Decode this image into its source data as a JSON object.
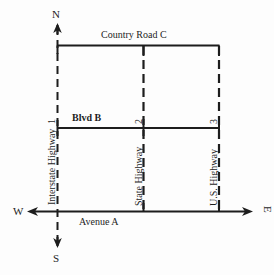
{
  "diagram": {
    "background_color": "#fdfdfd",
    "line_color": "#1d1d1d",
    "compass": {
      "north": "N",
      "south": "S",
      "west": "W",
      "east": "E"
    },
    "roads": [
      {
        "id": "country-road-c",
        "label": "Country Road C",
        "orientation": "horizontal",
        "style": "solid",
        "label_position": "above-center"
      },
      {
        "id": "blvd-b",
        "label": "Blvd B",
        "orientation": "horizontal",
        "style": "solid",
        "label_position": "above-left"
      },
      {
        "id": "avenue-a",
        "label": "Avenue A",
        "orientation": "horizontal",
        "style": "solid-axis-arrows",
        "label_position": "below-left"
      },
      {
        "id": "interstate-highway-1",
        "label": "Interstate Highway",
        "number": "1",
        "orientation": "vertical",
        "style": "dashed-axis-arrows",
        "label_position": "rotated-left-of-line"
      },
      {
        "id": "state-highway-2",
        "label": "State Highway",
        "number": "2",
        "orientation": "vertical",
        "style": "dashed",
        "label_position": "rotated-left-of-line"
      },
      {
        "id": "us-highway-3",
        "label": "U.S. Highway",
        "number": "3",
        "orientation": "vertical",
        "style": "dashed",
        "label_position": "rotated-left-of-line"
      }
    ]
  }
}
